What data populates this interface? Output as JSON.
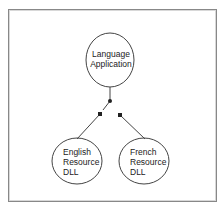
{
  "diagram": {
    "type": "switch-diagram",
    "nodes": [
      {
        "id": "app",
        "lines": [
          "Language",
          "Application"
        ]
      },
      {
        "id": "english",
        "lines": [
          "English",
          "Resource",
          "DLL"
        ]
      },
      {
        "id": "french",
        "lines": [
          "French",
          "Resource",
          "DLL"
        ]
      }
    ],
    "edges": [
      {
        "from": "app",
        "to": "switch",
        "state": "connected"
      },
      {
        "from": "switch",
        "to": "english",
        "state": "selected"
      },
      {
        "from": "switch",
        "to": "french",
        "state": "open"
      }
    ],
    "colors": {
      "line": "#444444",
      "border": "#888888",
      "background": "#ffffff"
    }
  }
}
